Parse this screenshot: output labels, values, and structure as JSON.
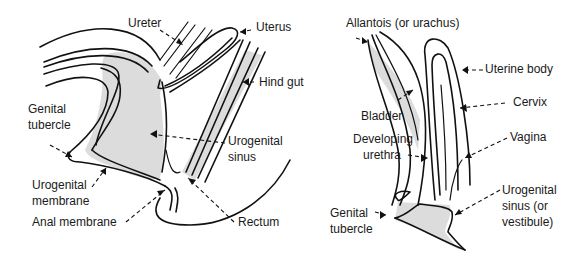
{
  "figure": {
    "left_panel": {
      "labels": {
        "ureter": "Ureter",
        "uterus": "Uterus",
        "hind_gut": "Hind gut",
        "genital_tubercle_1": "Genital",
        "genital_tubercle_2": "tubercle",
        "urogenital_sinus_1": "Urogenital",
        "urogenital_sinus_2": "sinus",
        "urogenital_membrane_1": "Urogenital",
        "urogenital_membrane_2": "membrane",
        "anal_membrane": "Anal membrane",
        "rectum": "Rectum"
      }
    },
    "right_panel": {
      "labels": {
        "allantois": "Allantois (or urachus)",
        "uterine_body": "Uterine body",
        "bladder": "Bladder",
        "cervix": "Cervix",
        "developing_urethra_1": "Developing",
        "developing_urethra_2": "urethra",
        "vagina": "Vagina",
        "urogenital_sinus_1": "Urogenital",
        "urogenital_sinus_2": "sinus (or",
        "urogenital_sinus_3": "vestibule)",
        "genital_tubercle_1": "Genital",
        "genital_tubercle_2": "tubercle"
      }
    },
    "colors": {
      "line": "#111111",
      "shading": "#dcdcdc",
      "background": "#ffffff"
    }
  }
}
